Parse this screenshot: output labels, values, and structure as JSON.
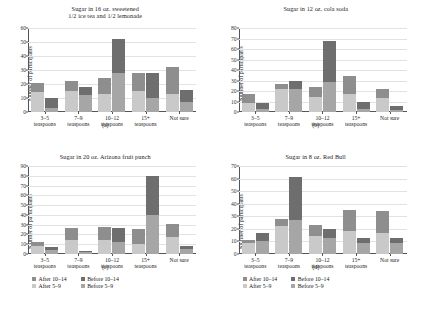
{
  "axis": {
    "ylabel": "Number of participants",
    "categories": [
      "3–5\nteaspoons",
      "7–9\nteaspoons",
      "10–12\nteaspoons",
      "15+\nteaspoons",
      "Not sure"
    ]
  },
  "legend": {
    "items": [
      {
        "label": "After 10–14",
        "color": "#8e8e8e",
        "key": "after_10_14"
      },
      {
        "label": "Before 10–14",
        "color": "#6e6e6e",
        "key": "before_10_14"
      },
      {
        "label": "After 5–9",
        "color": "#c9c9c9",
        "key": "after_5_9"
      },
      {
        "label": "Before 5–9",
        "color": "#a6a6a6",
        "key": "before_5_9"
      }
    ]
  },
  "captions": {
    "a": "(a)",
    "b": "(b)",
    "c": "(c)",
    "d": "(d)"
  },
  "chart_data": [
    {
      "type": "bar",
      "panel": "a",
      "title": "Sugar in 16 oz. sweetened\n1/2 ice tea and 1/2 lemonade",
      "xlabel": "",
      "ylabel": "Number of participants",
      "ylim": [
        0,
        60
      ],
      "yticks": [
        0,
        10,
        20,
        30,
        40,
        50,
        60
      ],
      "grid": true,
      "legend_position": "below-figure",
      "categories": [
        "3–5 teaspoons",
        "7–9 teaspoons",
        "10–12 teaspoons",
        "15+ teaspoons",
        "Not sure"
      ],
      "series": [
        {
          "name": "After 5–9",
          "values": [
            14,
            15,
            13,
            15,
            13
          ]
        },
        {
          "name": "After 10–14",
          "values": [
            7,
            7,
            11,
            13,
            19
          ]
        },
        {
          "name": "Before 5–9",
          "values": [
            3,
            12,
            28,
            10,
            7
          ]
        },
        {
          "name": "Before 10–14",
          "values": [
            7,
            6,
            24,
            18,
            9
          ]
        }
      ],
      "totals": {
        "after": [
          21,
          22,
          24,
          28,
          32
        ],
        "before": [
          10,
          18,
          52,
          28,
          16
        ]
      }
    },
    {
      "type": "bar",
      "panel": "b",
      "title": "Sugar in 12 oz. cola soda",
      "xlabel": "",
      "ylabel": "Number of participants",
      "ylim": [
        0,
        80
      ],
      "yticks": [
        0,
        10,
        20,
        30,
        40,
        50,
        60,
        70,
        80
      ],
      "grid": true,
      "legend_position": "below-figure",
      "categories": [
        "3–5 teaspoons",
        "7–9 teaspoons",
        "10–12 teaspoons",
        "15+ teaspoons",
        "Not sure"
      ],
      "series": [
        {
          "name": "After 5–9",
          "values": [
            9,
            22,
            14,
            17,
            13
          ]
        },
        {
          "name": "After 10–14",
          "values": [
            8,
            5,
            10,
            17,
            9
          ]
        },
        {
          "name": "Before 5–9",
          "values": [
            3,
            22,
            29,
            3,
            2
          ]
        },
        {
          "name": "Before 10–14",
          "values": [
            6,
            8,
            39,
            7,
            4
          ]
        }
      ],
      "totals": {
        "after": [
          17,
          27,
          24,
          34,
          22
        ],
        "before": [
          9,
          30,
          68,
          10,
          6
        ]
      }
    },
    {
      "type": "bar",
      "panel": "c",
      "title": "Sugar in 20 oz. Arizona fruit punch",
      "xlabel": "",
      "ylabel": "Number of participants",
      "ylim": [
        0,
        90
      ],
      "yticks": [
        0,
        10,
        20,
        30,
        40,
        50,
        60,
        70,
        80,
        90
      ],
      "grid": true,
      "legend_position": "below-figure",
      "categories": [
        "3–5 teaspoons",
        "7–9 teaspoons",
        "10–12 teaspoons",
        "15+ teaspoons",
        "Not sure"
      ],
      "series": [
        {
          "name": "After 5–9",
          "values": [
            8,
            14,
            14,
            10,
            17
          ]
        },
        {
          "name": "After 10–14",
          "values": [
            4,
            13,
            14,
            16,
            14
          ]
        },
        {
          "name": "Before 5–9",
          "values": [
            4,
            2,
            12,
            40,
            5
          ]
        },
        {
          "name": "Before 10–14",
          "values": [
            3,
            1,
            15,
            40,
            3
          ]
        }
      ],
      "totals": {
        "after": [
          12,
          27,
          28,
          26,
          31
        ],
        "before": [
          7,
          3,
          27,
          80,
          8
        ]
      }
    },
    {
      "type": "bar",
      "panel": "d",
      "title": "Sugar in 8 oz. Red Bull",
      "xlabel": "",
      "ylabel": "Number of participants",
      "ylim": [
        0,
        70
      ],
      "yticks": [
        0,
        10,
        20,
        30,
        40,
        50,
        60,
        70
      ],
      "grid": true,
      "legend_position": "below-figure",
      "categories": [
        "3–5 teaspoons",
        "7–9 teaspoons",
        "10–12 teaspoons",
        "15+ teaspoons",
        "Not sure"
      ],
      "series": [
        {
          "name": "After 5–9",
          "values": [
            9,
            22,
            14,
            18,
            17
          ]
        },
        {
          "name": "After 10–14",
          "values": [
            2,
            6,
            9,
            17,
            17
          ]
        },
        {
          "name": "Before 5–9",
          "values": [
            10,
            27,
            13,
            9,
            9
          ]
        },
        {
          "name": "Before 10–14",
          "values": [
            7,
            34,
            7,
            4,
            4
          ]
        }
      ],
      "totals": {
        "after": [
          11,
          28,
          23,
          35,
          34
        ],
        "before": [
          17,
          61,
          20,
          13,
          13
        ]
      }
    }
  ]
}
